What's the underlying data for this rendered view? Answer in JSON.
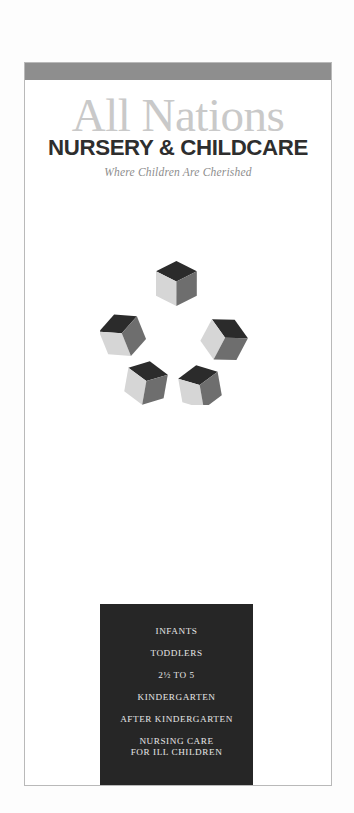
{
  "document": {
    "kind": "printed-brochure-panel",
    "background_color": "#ffffff"
  },
  "page": {
    "header_band_color": "#8e8e8e",
    "border_color": "#b9b9b9"
  },
  "masthead": {
    "brand_primary": "All Nations",
    "brand_primary_color": "#c9c9c9",
    "brand_secondary": "NURSERY & CHILDCARE",
    "brand_secondary_color": "#2e2e2e",
    "tagline": "Where Children Are Cherished",
    "tagline_color": "#8d8d8d"
  },
  "illustration": {
    "name": "five-cubes-ring",
    "cube_count": 5,
    "top_face_color": "#2b2b2b",
    "left_face_color": "#d6d6d6",
    "right_face_color": "#6e6e6e"
  },
  "services_panel": {
    "background_color": "#262626",
    "text_color": "#e6e6e6",
    "items": [
      {
        "label": "INFANTS"
      },
      {
        "label": "TODDLERS"
      },
      {
        "label": "2½ TO 5"
      },
      {
        "label": "KINDERGARTEN"
      },
      {
        "label": "AFTER KINDERGARTEN"
      },
      {
        "label": "NURSING CARE",
        "sub": "FOR ILL CHILDREN"
      }
    ]
  }
}
